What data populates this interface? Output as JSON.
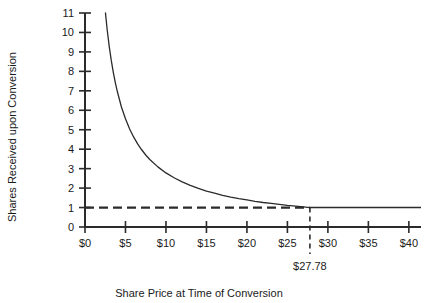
{
  "chart_data": {
    "type": "line",
    "title": "",
    "xlabel": "Share Price at Time of Conversion",
    "ylabel": "Shares Received upon Conversion",
    "xlim": [
      0,
      41.5
    ],
    "ylim": [
      0,
      11
    ],
    "grid": false,
    "legend": null,
    "x_tick_labels": [
      "$0",
      "$5",
      "$10",
      "$15",
      "$20",
      "$25",
      "$30",
      "$35",
      "$40"
    ],
    "x_tick_values": [
      0,
      5,
      10,
      15,
      20,
      25,
      30,
      35,
      40
    ],
    "y_tick_labels": [
      "0",
      "1",
      "2",
      "3",
      "4",
      "5",
      "6",
      "7",
      "8",
      "9",
      "10",
      "11"
    ],
    "y_tick_values": [
      0,
      1,
      2,
      3,
      4,
      5,
      6,
      7,
      8,
      9,
      10,
      11
    ],
    "series": [
      {
        "name": "Shares received (conversion ratio)",
        "style": "solid-curve",
        "formula": "y = 27.78 / x for x <= 27.78",
        "x": [
          2.53,
          2.75,
          3.0,
          3.25,
          3.5,
          3.75,
          4.0,
          4.5,
          5.0,
          5.5,
          6.0,
          6.5,
          7.0,
          7.5,
          8.0,
          9.0,
          10.0,
          11.0,
          12.0,
          13.0,
          14.0,
          15.0,
          16.0,
          17.0,
          18.0,
          19.0,
          20.0,
          21.0,
          22.0,
          23.0,
          24.0,
          25.0,
          26.0,
          27.0,
          27.78
        ],
        "y": [
          11.0,
          10.1,
          9.26,
          8.55,
          7.94,
          7.41,
          6.95,
          6.17,
          5.56,
          5.05,
          4.63,
          4.27,
          3.97,
          3.7,
          3.47,
          3.09,
          2.78,
          2.53,
          2.32,
          2.14,
          1.98,
          1.85,
          1.74,
          1.63,
          1.54,
          1.46,
          1.39,
          1.32,
          1.26,
          1.21,
          1.16,
          1.11,
          1.07,
          1.03,
          1.0
        ]
      },
      {
        "name": "Floor of one share (dashed)",
        "style": "dashed-horizontal",
        "x": [
          0,
          27.78
        ],
        "y": [
          1,
          1
        ]
      },
      {
        "name": "Floor of one share (solid)",
        "style": "solid-horizontal",
        "x": [
          27.78,
          41.5
        ],
        "y": [
          1,
          1
        ]
      }
    ],
    "annotations": [
      {
        "name": "conversion-price-marker",
        "label": "$27.78",
        "x": 27.78,
        "type": "vertical-dashed-line-with-label"
      }
    ],
    "colors": {
      "curve": "#2b2b2b",
      "axis": "#2b2b2b",
      "text": "#1a1a1a",
      "background": "#ffffff"
    }
  }
}
